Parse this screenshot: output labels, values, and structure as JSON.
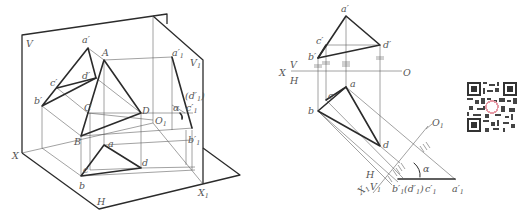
{
  "figure": {
    "left_view": {
      "planes": [
        "V",
        "H",
        "V1"
      ],
      "axes": [
        "X",
        "X1",
        "O1"
      ],
      "points_3d": [
        "A",
        "B",
        "C",
        "D"
      ],
      "labels": {
        "V": "V",
        "H": "H",
        "V1": "V",
        "V1_sub": "1",
        "X": "X",
        "X1": "X",
        "X1_sub": "1",
        "O1": "O",
        "O1_sub": "1",
        "a_prime": "a′",
        "b_prime": "b′",
        "c_prime": "c′",
        "d_prime": "d′",
        "A": "A",
        "B": "B",
        "C": "C",
        "D": "D",
        "a": "a",
        "b": "b",
        "c": "c",
        "d": "d",
        "a1_prime": "a′",
        "a1_sub": "1",
        "b1_prime": "b′",
        "b1_sub": "1",
        "c1_prime": "c′",
        "c1_sub": "1",
        "d1_prime": "(d′",
        "d1_sub": "1",
        "d1_close": ")",
        "alpha": "α"
      }
    },
    "right_view": {
      "labels": {
        "a_prime": "a′",
        "b_prime": "b′",
        "c_prime": "c′",
        "d_prime": "d′",
        "X": "X",
        "V": "V",
        "H": "H",
        "O": "O",
        "a": "a",
        "b": "b",
        "c": "c",
        "d": "d",
        "O1": "O",
        "O1_sub": "1",
        "X1": "X",
        "X1_sub": "1",
        "H2": "H",
        "V1": "V",
        "V1_sub": "1",
        "b1_prime": "b′",
        "b1_sub": "1",
        "d1_prime": "(d′",
        "d1_sub": "1",
        "d1_close": ")",
        "c1_prime": "c′",
        "c1_sub": "1",
        "a1_prime": "a′",
        "a1_sub": "1",
        "alpha": "α"
      }
    },
    "qr_code": "qr-code"
  }
}
